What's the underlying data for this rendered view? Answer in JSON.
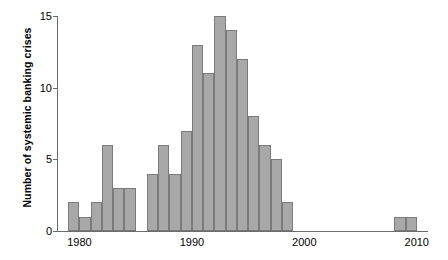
{
  "chart_data": {
    "type": "bar",
    "title": "",
    "subtitle": "",
    "xlabel": "",
    "ylabel": "Number of systemic banking crises",
    "xlim": [
      1978,
      2011
    ],
    "ylim": [
      0,
      15
    ],
    "grid": false,
    "legend": null,
    "bar_color": "#a8a8a8",
    "bar_edge_color": "#7b7b7b",
    "axis_color": "#6a6a6a",
    "xtick_labels": [
      "1980",
      "1990",
      "2000",
      "2010"
    ],
    "xtick_values": [
      1980,
      1990,
      2000,
      2010
    ],
    "ytick_labels": [
      "0",
      "5",
      "10",
      "15"
    ],
    "ytick_values": [
      0,
      5,
      10,
      15
    ],
    "categories": [
      1979,
      1980,
      1981,
      1982,
      1983,
      1984,
      1985,
      1986,
      1987,
      1988,
      1989,
      1990,
      1991,
      1992,
      1993,
      1994,
      1995,
      1996,
      1997,
      1998,
      1999,
      2000,
      2001,
      2002,
      2003,
      2004,
      2005,
      2006,
      2007,
      2008,
      2009
    ],
    "values": [
      2,
      1,
      2,
      6,
      3,
      3,
      0,
      4,
      6,
      4,
      7,
      13,
      11,
      15,
      14,
      12,
      8,
      6,
      5,
      2,
      0,
      0,
      0,
      0,
      0,
      0,
      0,
      0,
      0,
      1,
      1
    ]
  }
}
